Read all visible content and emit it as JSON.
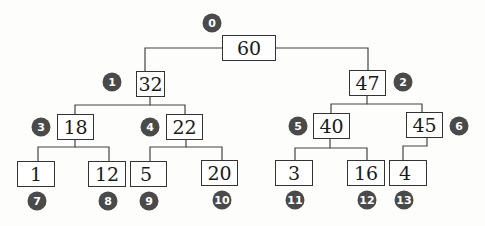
{
  "diagram": {
    "type": "binary-tree",
    "nodes": [
      {
        "index": "0",
        "value": "60"
      },
      {
        "index": "1",
        "value": "32"
      },
      {
        "index": "2",
        "value": "47"
      },
      {
        "index": "3",
        "value": "18"
      },
      {
        "index": "4",
        "value": "22"
      },
      {
        "index": "5",
        "value": "40"
      },
      {
        "index": "6",
        "value": "45"
      },
      {
        "index": "7",
        "value": "1"
      },
      {
        "index": "8",
        "value": "12"
      },
      {
        "index": "9",
        "value": "5"
      },
      {
        "index": "10",
        "value": "20"
      },
      {
        "index": "11",
        "value": "3"
      },
      {
        "index": "12",
        "value": "16"
      },
      {
        "index": "13",
        "value": "4"
      }
    ],
    "edges": [
      [
        0,
        1
      ],
      [
        0,
        2
      ],
      [
        1,
        3
      ],
      [
        1,
        4
      ],
      [
        2,
        5
      ],
      [
        2,
        6
      ],
      [
        3,
        7
      ],
      [
        3,
        8
      ],
      [
        4,
        9
      ],
      [
        4,
        10
      ],
      [
        5,
        11
      ],
      [
        5,
        12
      ],
      [
        6,
        13
      ]
    ],
    "colors": {
      "badge": "#4a4a4a",
      "line": "#333333"
    }
  }
}
